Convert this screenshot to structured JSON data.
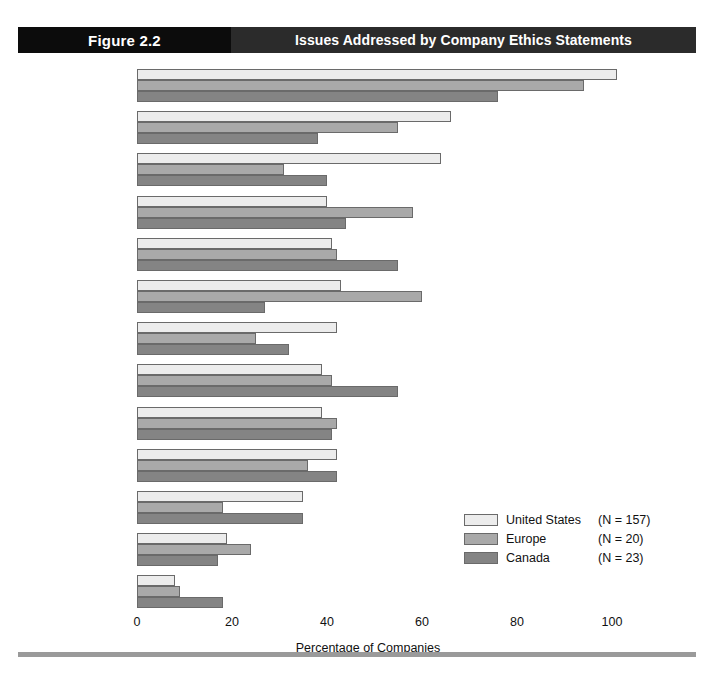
{
  "header": {
    "figure_label": "Figure 2.2",
    "title": "Issues Addressed by Company Ethics Statements"
  },
  "chart_data": {
    "type": "bar",
    "orientation": "horizontal",
    "title": "Issues Addressed by Company Ethics Statements",
    "xlabel": "Percentage of Companies",
    "ylabel": "",
    "xlim": [
      0,
      110
    ],
    "xticks": [
      0,
      20,
      40,
      60,
      80,
      100
    ],
    "grid": false,
    "legend_position": "middle-right",
    "categories": [
      "Fundamental guiding principles of company",
      "Purchasing",
      "Property information",
      "Workplace safety",
      "Environmental responsibility",
      "Marketing",
      "Intellectual property",
      "Confidentiality of employee records",
      "Product safety",
      "Employee privacy",
      "Drug-related issues",
      "Technological innovation",
      "AIDS"
    ],
    "series": [
      {
        "name": "United States",
        "n": 157,
        "legend_label": "United States",
        "legend_n": "(N = 157)",
        "color": "#ececec",
        "values": [
          101,
          66,
          64,
          40,
          41,
          43,
          42,
          39,
          39,
          42,
          35,
          19,
          8
        ]
      },
      {
        "name": "Europe",
        "n": 20,
        "legend_label": "Europe",
        "legend_n": "(N = 20)",
        "color": "#a9a9a9",
        "values": [
          94,
          55,
          31,
          58,
          42,
          60,
          25,
          41,
          42,
          36,
          18,
          24,
          9
        ]
      },
      {
        "name": "Canada",
        "n": 23,
        "legend_label": "Canada",
        "legend_n": "(N = 23)",
        "color": "#848484",
        "values": [
          76,
          38,
          40,
          44,
          55,
          27,
          32,
          55,
          41,
          42,
          35,
          17,
          18
        ]
      }
    ]
  },
  "category_label_lines": [
    [
      "Fundamental guiding",
      "principles of company"
    ],
    [
      "Purchasing"
    ],
    [
      "Property information"
    ],
    [
      "Workplace safety"
    ],
    [
      "Environmental",
      "responsibility"
    ],
    [
      "Marketing"
    ],
    [
      "Intellectual property"
    ],
    [
      "Confidentiality of",
      "employee records"
    ],
    [
      "Product safety"
    ],
    [
      "Employee privacy"
    ],
    [
      "Drug-related issues"
    ],
    [
      "Technological",
      "innovation"
    ],
    [
      "AIDS"
    ]
  ],
  "x_axis": {
    "tick_labels": [
      "0",
      "20",
      "40",
      "60",
      "80",
      "100"
    ],
    "title": "Percentage of Companies"
  },
  "colors": {
    "united_states": "#ececec",
    "europe": "#a9a9a9",
    "canada": "#848484",
    "header_dark": "#0c0c0c",
    "header_bar": "#2b2b2b",
    "footer_rule": "#9a9a9a",
    "bar_outline": "#6a6a6a"
  }
}
